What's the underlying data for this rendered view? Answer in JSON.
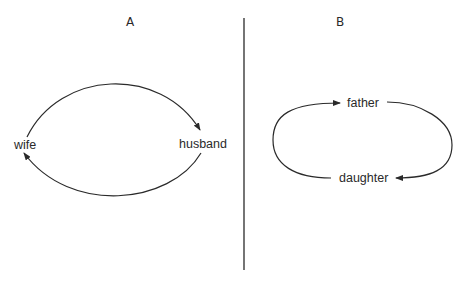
{
  "diagram": {
    "stroke_color": "#2a2a2a",
    "background": "#ffffff",
    "panel_a": {
      "title": "A",
      "nodes": [
        {
          "id": "wife",
          "label": "wife"
        },
        {
          "id": "husband",
          "label": "husband"
        }
      ],
      "edges": [
        {
          "from": "wife",
          "to": "husband",
          "path": "upper-arc"
        },
        {
          "from": "husband",
          "to": "wife",
          "path": "lower-arc"
        }
      ]
    },
    "divider": {
      "orientation": "vertical"
    },
    "panel_b": {
      "title": "B",
      "nodes": [
        {
          "id": "father",
          "label": "father"
        },
        {
          "id": "daughter",
          "label": "daughter"
        }
      ],
      "edges": [
        {
          "from": "daughter",
          "to": "father",
          "path": "left-loop"
        },
        {
          "from": "father",
          "to": "daughter",
          "path": "right-loop"
        }
      ]
    }
  }
}
